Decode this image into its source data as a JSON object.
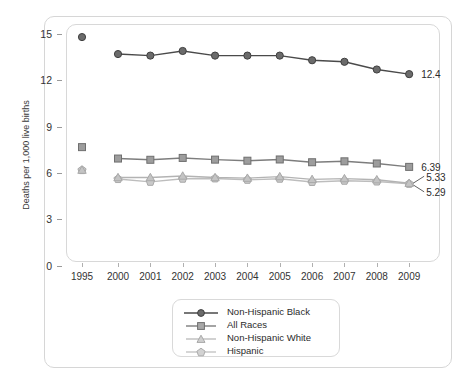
{
  "chart_data": {
    "type": "line",
    "title": "",
    "xlabel": "",
    "ylabel": "Deaths per 1,000 live births",
    "ylim": [
      0,
      15
    ],
    "yticks": [
      0,
      3,
      6,
      9,
      12,
      15
    ],
    "grid": false,
    "legend_position": "bottom-center",
    "categories": [
      "1995",
      "2000",
      "2001",
      "2002",
      "2003",
      "2004",
      "2005",
      "2006",
      "2007",
      "2008",
      "2009"
    ],
    "note": "1995 values are plotted as isolated markers with no connecting line to 2000",
    "series": [
      {
        "name": "Non-Hispanic Black",
        "marker": "circle",
        "color": "#6b6b6b",
        "line_color": "#4a4a4a",
        "values": [
          14.8,
          13.7,
          13.6,
          13.9,
          13.6,
          13.6,
          13.6,
          13.3,
          13.2,
          12.7,
          12.4
        ],
        "end_label": "12.4"
      },
      {
        "name": "All Races",
        "marker": "square",
        "color": "#9d9d9d",
        "line_color": "#7d7d7d",
        "values": [
          7.67,
          6.93,
          6.85,
          6.97,
          6.86,
          6.79,
          6.87,
          6.69,
          6.75,
          6.61,
          6.39
        ],
        "end_label": "6.39"
      },
      {
        "name": "Non-Hispanic White",
        "marker": "triangle",
        "color": "#c4c4c4",
        "line_color": "#b3b3b3",
        "values": [
          6.18,
          5.7,
          5.7,
          5.8,
          5.7,
          5.66,
          5.76,
          5.58,
          5.63,
          5.56,
          5.33
        ],
        "end_label": "5.33"
      },
      {
        "name": "Hispanic",
        "marker": "pentagon",
        "color": "#c9c9c9",
        "line_color": "#bdbdbd",
        "values": [
          6.18,
          5.6,
          5.42,
          5.62,
          5.64,
          5.55,
          5.62,
          5.41,
          5.49,
          5.44,
          5.29
        ],
        "end_label": "5.29"
      }
    ]
  },
  "axis": {
    "y_label": "Deaths per 1,000 live births",
    "y_ticks": [
      "0",
      "3",
      "6",
      "9",
      "12",
      "15"
    ],
    "x_ticks": [
      "1995",
      "2000",
      "2001",
      "2002",
      "2003",
      "2004",
      "2005",
      "2006",
      "2007",
      "2008",
      "2009"
    ]
  },
  "legend": {
    "items": [
      {
        "label": "Non-Hispanic Black"
      },
      {
        "label": "All Races"
      },
      {
        "label": "Non-Hispanic White"
      },
      {
        "label": "Hispanic"
      }
    ]
  },
  "data_labels": [
    "12.4",
    "6.39",
    "5.33",
    "5.29"
  ]
}
